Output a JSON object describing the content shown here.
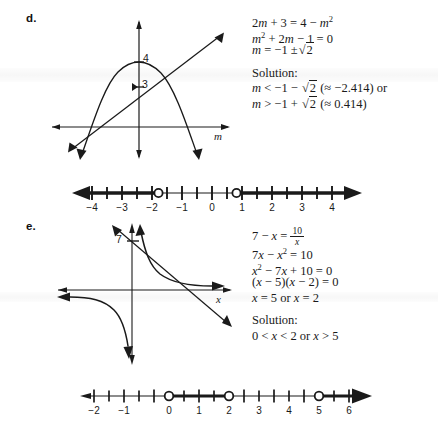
{
  "page": {
    "background": "#ffffff",
    "ink": "#1a1a1a",
    "width": 438,
    "height": 435
  },
  "parts": [
    {
      "id": "d",
      "label": "d.",
      "graph": {
        "axis_label": "m",
        "y_intercept_labels": [
          "4",
          "3"
        ],
        "curves": [
          {
            "name": "parabola",
            "expression": "y = 4 - m^2",
            "vertex_y": 4
          },
          {
            "name": "line",
            "expression": "y = 2m + 3",
            "y_intercept": 3
          }
        ]
      },
      "work": [
        {
          "type": "equation",
          "text": "2m + 3 = 4 − m²"
        },
        {
          "type": "equation",
          "text": "m² + 2m − 1 = 0"
        },
        {
          "type": "equation",
          "text": "m = −1 ±√2"
        },
        {
          "type": "heading",
          "text": "Solution:"
        },
        {
          "type": "equation",
          "text": "m < −1 − √2 (≈ −2.414) or"
        },
        {
          "type": "equation",
          "text": "m > −1 + √2 (≈ 0.414)"
        }
      ],
      "solution_label": "Solution:",
      "approximations": [
        "≈ −2.414",
        "≈ 0.414"
      ],
      "numberline": {
        "ticks": [
          -4,
          -3,
          -2,
          -1,
          0,
          1,
          2,
          3,
          4
        ],
        "tick_labels": [
          "−4",
          "−3",
          "−2",
          "−1",
          "0",
          "1",
          "2",
          "3",
          "4"
        ],
        "min": -4.6,
        "max": 4.6,
        "open_points": [
          -2.414,
          0.414
        ],
        "shaded_rays": [
          {
            "from": "-∞",
            "to": -2.414
          },
          {
            "from": 0.414,
            "to": "+∞"
          }
        ],
        "left_arrow": true,
        "right_arrow": true
      }
    },
    {
      "id": "e",
      "label": "e.",
      "graph": {
        "axis_label": "x",
        "y_intercept_labels": [
          "7"
        ],
        "curves": [
          {
            "name": "hyperbola",
            "expression": "y = 10/x"
          },
          {
            "name": "line",
            "expression": "y = 7 - x",
            "y_intercept": 7
          }
        ]
      },
      "work": [
        {
          "type": "equation",
          "text": "7 − x = 10/x"
        },
        {
          "type": "equation",
          "text": "7x − x² = 10"
        },
        {
          "type": "equation",
          "text": "x² − 7x + 10 = 0"
        },
        {
          "type": "equation",
          "text": "(x − 5)(x − 2) = 0"
        },
        {
          "type": "equation",
          "text": "x = 5 or x = 2"
        },
        {
          "type": "heading",
          "text": "Solution:"
        },
        {
          "type": "equation",
          "text": "0 < x < 2 or x > 5"
        }
      ],
      "solution_label": "Solution:",
      "numberline": {
        "ticks": [
          -2,
          -1,
          0,
          1,
          2,
          3,
          4,
          5,
          6
        ],
        "tick_labels": [
          "−2",
          "−1",
          "0",
          "1",
          "2",
          "3",
          "4",
          "5",
          "6"
        ],
        "min": -2.5,
        "max": 6.7,
        "open_points": [
          0,
          2,
          5
        ],
        "shaded_segments": [
          {
            "from": 0,
            "to": 2
          },
          {
            "from": 5,
            "to": "+∞"
          }
        ],
        "left_arrow": true,
        "right_arrow": true
      }
    }
  ]
}
